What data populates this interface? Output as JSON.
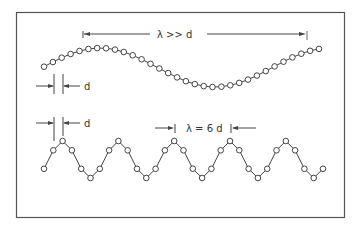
{
  "figure": {
    "frame": {
      "x": 16,
      "y": 12,
      "width": 328,
      "height": 205,
      "color": "#555555"
    },
    "top_wave": {
      "label": "λ >> d",
      "wavelength_relation": "lambda much greater than d",
      "circle_count": 32,
      "spacing_label": "d"
    },
    "bottom_wave": {
      "label": "λ = 6 d",
      "wavelength_relation": "lambda equals 6 d",
      "circles_per_wavelength": 6,
      "circle_count": 32,
      "spacing_label": "d"
    },
    "colors": {
      "stroke": "#444444",
      "circle_fill": "#ffffff",
      "text": "#333333"
    }
  }
}
